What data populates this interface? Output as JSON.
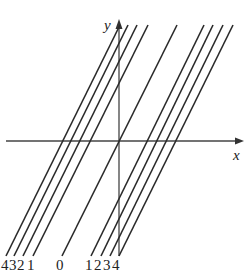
{
  "axes": {
    "x_label": "x",
    "y_label": "y",
    "color": "#333333"
  },
  "lines": {
    "color": "#2a2a2a",
    "offsets": [
      -4,
      -3,
      -2,
      -1,
      0,
      1,
      2,
      3,
      4
    ]
  },
  "bottom_labels": {
    "neg4": "4",
    "neg3": "3",
    "neg2": "2",
    "neg1": "1",
    "zero": "0",
    "pos1": "1",
    "pos2": "2",
    "pos3": "3",
    "pos4": "4"
  }
}
